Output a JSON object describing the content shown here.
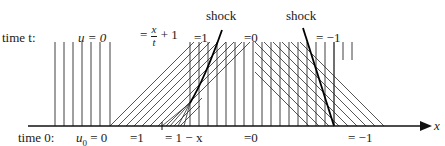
{
  "figure": {
    "axis_label": "x",
    "row_labels": {
      "top": "time t:",
      "bottom": "time 0:"
    },
    "top_labels": {
      "u_eq_0": "u = 0",
      "fan_lhs": "=",
      "fan_num": "x",
      "fan_den": "t",
      "fan_rhs": "+ 1",
      "eq_1": "=1",
      "eq_0": "=0",
      "eq_neg1": "= −1"
    },
    "bottom_labels": {
      "u0_eq_0_u": "u",
      "u0_eq_0_sub": "0",
      "u0_eq_0_rest": " = 0",
      "eq_1": "=1",
      "eq_1_minus_x": "= 1 − x",
      "eq_0": "=0",
      "eq_neg1": "= −1"
    },
    "annotations": {
      "shock_left": "shock",
      "shock_right": "shock"
    },
    "colors": {
      "line": "#2a2a2a",
      "shock": "#000000",
      "background": "#ffffff"
    }
  }
}
